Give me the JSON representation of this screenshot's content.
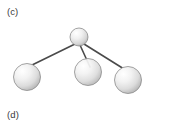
{
  "figure": {
    "background_color": "#ffffff",
    "panels": [
      {
        "id": "panel-c",
        "label": "(c)"
      },
      {
        "id": "panel-d",
        "label": "(d)"
      }
    ],
    "label_color": "#3a3a3a"
  },
  "molecule": {
    "caption": "(c)",
    "style": "ball-and-stick",
    "sphere_fill_light": "#ffffff",
    "sphere_fill_mid": "#e6e6e6",
    "sphere_fill_dark": "#a8a8a8",
    "sphere_outline": "#8c8c8c",
    "bond_color": "#4a4a4a",
    "atoms": [
      {
        "id": "atom-top",
        "cx": 79,
        "cy": 37,
        "r": 9,
        "role": "central-small"
      },
      {
        "id": "atom-left",
        "cx": 27,
        "cy": 77,
        "r": 13.5,
        "role": "terminal-large"
      },
      {
        "id": "atom-middle",
        "cx": 88,
        "cy": 72,
        "r": 13.5,
        "role": "terminal-large"
      },
      {
        "id": "atom-right",
        "cx": 128,
        "cy": 80,
        "r": 13.5,
        "role": "terminal-large"
      }
    ],
    "bonds": [
      {
        "id": "bond-top-left",
        "x1": 75,
        "y1": 44,
        "x2": 30,
        "y2": 66
      },
      {
        "id": "bond-top-middle",
        "x1": 80,
        "y1": 45,
        "x2": 90,
        "y2": 67
      },
      {
        "id": "bond-top-right",
        "x1": 84,
        "y1": 44,
        "x2": 124,
        "y2": 69
      }
    ]
  }
}
